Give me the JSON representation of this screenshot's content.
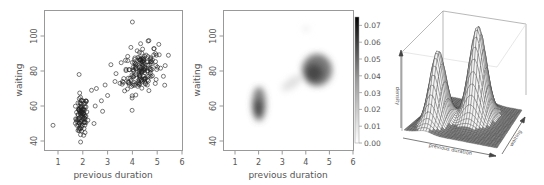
{
  "chart_data": [
    {
      "type": "scatter",
      "title": "",
      "xlabel": "previous duration",
      "ylabel": "waiting",
      "xlim": [
        0.6,
        6
      ],
      "ylim": [
        35,
        112
      ],
      "xticks": [
        1,
        2,
        3,
        4,
        5,
        6
      ],
      "yticks": [
        40,
        60,
        80,
        100
      ],
      "grid": false,
      "marker": "open-circle",
      "clusters": [
        {
          "name": "short eruptions",
          "center_x": 1.95,
          "center_y": 54,
          "sd_x": 0.12,
          "sd_y": 5.5,
          "n": 95
        },
        {
          "name": "long eruptions",
          "center_x": 4.35,
          "center_y": 81,
          "sd_x": 0.35,
          "sd_y": 6.5,
          "n": 170
        }
      ],
      "outliers": [
        [
          0.8,
          49
        ],
        [
          1.85,
          78
        ],
        [
          4.0,
          108
        ],
        [
          5.45,
          89
        ],
        [
          5.25,
          77
        ],
        [
          2.35,
          69
        ],
        [
          2.55,
          70
        ],
        [
          2.9,
          72
        ],
        [
          3.0,
          66
        ],
        [
          2.8,
          57
        ],
        [
          2.45,
          50
        ],
        [
          3.3,
          74
        ],
        [
          3.5,
          73
        ],
        [
          2.75,
          63
        ],
        [
          3.6,
          74
        ],
        [
          2.5,
          60
        ]
      ]
    },
    {
      "type": "heatmap",
      "title": "",
      "xlabel": "previous duration",
      "ylabel": "waiting",
      "xlim": [
        0.5,
        6
      ],
      "ylim": [
        35,
        112
      ],
      "xticks": [
        1,
        2,
        3,
        4,
        5,
        6
      ],
      "yticks": [
        40,
        60,
        80,
        100
      ],
      "colorbar": {
        "min": 0.0,
        "max": 0.075,
        "ticks": [
          "0.00",
          "0.01",
          "0.02",
          "0.03",
          "0.04",
          "0.05",
          "0.06",
          "0.07"
        ],
        "colormap": "white-to-black"
      },
      "modes": [
        {
          "x": 1.95,
          "y": 54,
          "peak_density": 0.055
        },
        {
          "x": 4.3,
          "y": 80,
          "peak_density": 0.072
        }
      ]
    },
    {
      "type": "surface3d",
      "title": "",
      "xlabel": "previous duration",
      "ylabel": "waiting",
      "zlabel": "density",
      "modes": [
        {
          "x": 1.95,
          "y": 54,
          "relative_height": 0.78
        },
        {
          "x": 4.3,
          "y": 80,
          "relative_height": 1.0
        }
      ]
    }
  ],
  "panels": {
    "scatter": {
      "xlabel": "previous duration",
      "ylabel": "waiting"
    },
    "density": {
      "xlabel": "previous duration",
      "ylabel": "waiting"
    },
    "surface": {
      "xlabel": "previous duration",
      "ylabel": "waiting",
      "zlabel": "density"
    }
  }
}
